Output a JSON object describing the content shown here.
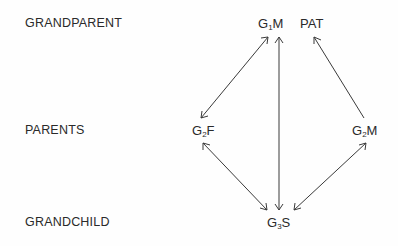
{
  "row_labels": {
    "grandparent": "GRANDPARENT",
    "parents": "PARENTS",
    "grandchild": "GRANDCHILD"
  },
  "nodes": {
    "g1m": {
      "prefix": "G",
      "sub": "1",
      "suffix": "M"
    },
    "pat": {
      "text": "PAT"
    },
    "g2f": {
      "prefix": "G",
      "sub": "2",
      "suffix": "F"
    },
    "g2m": {
      "prefix": "G",
      "sub": "2",
      "suffix": "M"
    },
    "g3s": {
      "prefix": "G",
      "sub": "3",
      "suffix": "S"
    }
  },
  "edges": [
    {
      "from": "G1M",
      "to": "G2F",
      "direction": "both"
    },
    {
      "from": "G1M",
      "to": "G3S",
      "direction": "both"
    },
    {
      "from": "G2M",
      "to": "PAT",
      "direction": "to"
    },
    {
      "from": "G2F",
      "to": "G3S",
      "direction": "both"
    },
    {
      "from": "G2M",
      "to": "G3S",
      "direction": "both"
    }
  ],
  "colors": {
    "ink": "#2a2a2a",
    "background": "#fefefe"
  }
}
